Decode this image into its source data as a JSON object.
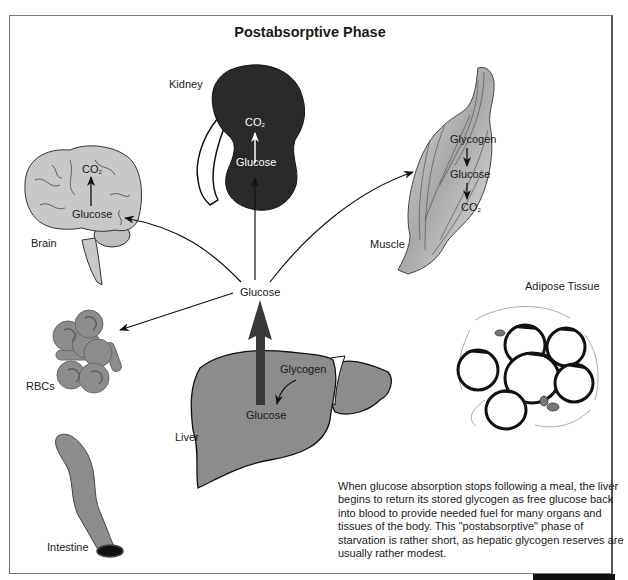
{
  "title": "Postabsorptive Phase",
  "organs": {
    "kidney": {
      "label": "Kidney",
      "metabolite_from": "Glucose",
      "metabolite_to": "CO",
      "subscript": "2"
    },
    "brain": {
      "label": "Brain",
      "metabolite_from": "Glucose",
      "metabolite_to": "CO",
      "subscript": "2"
    },
    "muscle": {
      "label": "Muscle",
      "steps": [
        "Glycogen",
        "Glucose",
        "CO"
      ],
      "subscript": "2"
    },
    "adipose": {
      "label": "Adipose Tissue"
    },
    "rbcs": {
      "label": "RBCs"
    },
    "liver": {
      "label": "Liver",
      "metabolite_from": "Glycogen",
      "metabolite_to": "Glucose"
    },
    "intestine": {
      "label": "Intestine"
    }
  },
  "central_node": {
    "label": "Glucose"
  },
  "colors": {
    "kidney_fill": "#2a2a2a",
    "organ_gray": "#8c8c8c",
    "light_gray": "#c8c8c8",
    "liver_arrow": "#3a3a3a"
  },
  "description": "When glucose absorption stops following a meal, the liver begins to return its stored glycogen as free glucose back into blood to provide needed fuel for many organs and tissues of the body. This \"postabsorptive\" phase of starvation is rather short, as hepatic glycogen reserves are usually rather modest."
}
